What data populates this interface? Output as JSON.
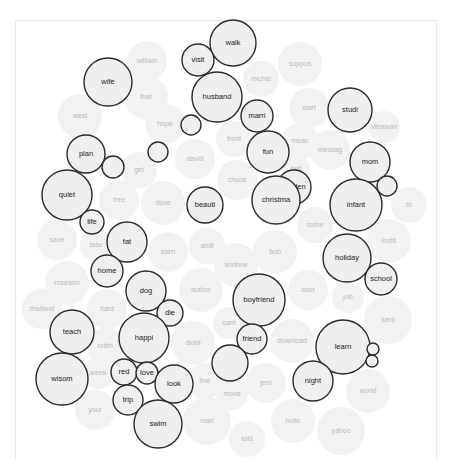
{
  "chart_data": {
    "type": "bubble-cloud",
    "title": "",
    "colors": {
      "highlight_stroke": "#2b2b2b",
      "highlight_fill": "#efefef",
      "background_fill": "#f2f2f2",
      "background_text": "#b8b8b8",
      "highlight_text": "#222222"
    },
    "background_words": [
      {
        "label": "william",
        "x": 147,
        "y": 61,
        "r": 20
      },
      {
        "label": "that",
        "x": 146,
        "y": 97,
        "r": 22
      },
      {
        "label": "west",
        "x": 80,
        "y": 116,
        "r": 22
      },
      {
        "label": "hope",
        "x": 165,
        "y": 124,
        "r": 20
      },
      {
        "label": "michel",
        "x": 261,
        "y": 79,
        "r": 18
      },
      {
        "label": "suppos",
        "x": 300,
        "y": 64,
        "r": 22
      },
      {
        "label": "start",
        "x": 309,
        "y": 108,
        "r": 20
      },
      {
        "label": "vitrawan",
        "x": 384,
        "y": 127,
        "r": 16
      },
      {
        "label": "front",
        "x": 234,
        "y": 139,
        "r": 18
      },
      {
        "label": "mean",
        "x": 300,
        "y": 141,
        "r": 18
      },
      {
        "label": "messag",
        "x": 330,
        "y": 150,
        "r": 20
      },
      {
        "label": "david",
        "x": 195,
        "y": 159,
        "r": 20
      },
      {
        "label": "get",
        "x": 139,
        "y": 170,
        "r": 18
      },
      {
        "label": "choos",
        "x": 237,
        "y": 180,
        "r": 20
      },
      {
        "label": "twit",
        "x": 296,
        "y": 169,
        "r": 14
      },
      {
        "label": "free",
        "x": 119,
        "y": 200,
        "r": 20
      },
      {
        "label": "dove",
        "x": 163,
        "y": 203,
        "r": 22
      },
      {
        "label": "tri",
        "x": 409,
        "y": 205,
        "r": 18
      },
      {
        "label": "come",
        "x": 315,
        "y": 225,
        "r": 18
      },
      {
        "label": "save",
        "x": 57,
        "y": 240,
        "r": 20
      },
      {
        "label": "leav",
        "x": 96,
        "y": 245,
        "r": 16
      },
      {
        "label": "instit",
        "x": 389,
        "y": 241,
        "r": 22
      },
      {
        "label": "barri",
        "x": 168,
        "y": 252,
        "r": 20
      },
      {
        "label": "andi",
        "x": 207,
        "y": 246,
        "r": 18
      },
      {
        "label": "bob",
        "x": 275,
        "y": 252,
        "r": 22
      },
      {
        "label": "andrew",
        "x": 236,
        "y": 265,
        "r": 22
      },
      {
        "label": "roseann",
        "x": 67,
        "y": 283,
        "r": 22
      },
      {
        "label": "author",
        "x": 201,
        "y": 290,
        "r": 22
      },
      {
        "label": "door",
        "x": 308,
        "y": 290,
        "r": 20
      },
      {
        "label": "job",
        "x": 348,
        "y": 297,
        "r": 16
      },
      {
        "label": "thailand",
        "x": 42,
        "y": 309,
        "r": 20
      },
      {
        "label": "hard",
        "x": 107,
        "y": 309,
        "r": 20
      },
      {
        "label": "sent",
        "x": 388,
        "y": 320,
        "r": 24
      },
      {
        "label": "cant",
        "x": 229,
        "y": 323,
        "r": 16
      },
      {
        "label": "robin",
        "x": 105,
        "y": 346,
        "r": 18
      },
      {
        "label": "didnt",
        "x": 193,
        "y": 343,
        "r": 22
      },
      {
        "label": "download",
        "x": 292,
        "y": 341,
        "r": 22
      },
      {
        "label": "week",
        "x": 98,
        "y": 373,
        "r": 16
      },
      {
        "label": "line",
        "x": 205,
        "y": 381,
        "r": 18
      },
      {
        "label": "jerri",
        "x": 266,
        "y": 383,
        "r": 20
      },
      {
        "label": "world",
        "x": 368,
        "y": 391,
        "r": 22
      },
      {
        "label": "move",
        "x": 232,
        "y": 394,
        "r": 16
      },
      {
        "label": "your",
        "x": 95,
        "y": 410,
        "r": 20
      },
      {
        "label": "marl",
        "x": 207,
        "y": 421,
        "r": 24
      },
      {
        "label": "notic",
        "x": 293,
        "y": 421,
        "r": 22
      },
      {
        "label": "yahoo",
        "x": 341,
        "y": 431,
        "r": 24
      },
      {
        "label": "told",
        "x": 247,
        "y": 439,
        "r": 18
      }
    ],
    "highlighted_words": [
      {
        "label": "walk",
        "x": 233,
        "y": 43,
        "r": 23
      },
      {
        "label": "visit",
        "x": 198,
        "y": 60,
        "r": 16
      },
      {
        "label": "wife",
        "x": 108,
        "y": 82,
        "r": 24
      },
      {
        "label": "husband",
        "x": 217,
        "y": 97,
        "r": 25
      },
      {
        "label": "",
        "x": 191,
        "y": 125,
        "r": 10
      },
      {
        "label": "marri",
        "x": 257,
        "y": 116,
        "r": 16
      },
      {
        "label": "studi",
        "x": 350,
        "y": 110,
        "r": 22
      },
      {
        "label": "plan",
        "x": 86,
        "y": 154,
        "r": 19
      },
      {
        "label": "",
        "x": 113,
        "y": 167,
        "r": 11
      },
      {
        "label": "",
        "x": 158,
        "y": 152,
        "r": 10
      },
      {
        "label": "fun",
        "x": 268,
        "y": 152,
        "r": 21
      },
      {
        "label": "mom",
        "x": 370,
        "y": 162,
        "r": 20
      },
      {
        "label": "",
        "x": 387,
        "y": 186,
        "r": 10
      },
      {
        "label": "quiet",
        "x": 67,
        "y": 195,
        "r": 25
      },
      {
        "label": "garden",
        "x": 294,
        "y": 187,
        "r": 17
      },
      {
        "label": "infant",
        "x": 356,
        "y": 205,
        "r": 26
      },
      {
        "label": "christma",
        "x": 276,
        "y": 200,
        "r": 24
      },
      {
        "label": "beauti",
        "x": 205,
        "y": 205,
        "r": 18
      },
      {
        "label": "life",
        "x": 92,
        "y": 222,
        "r": 12
      },
      {
        "label": "fat",
        "x": 127,
        "y": 242,
        "r": 20
      },
      {
        "label": "holiday",
        "x": 347,
        "y": 258,
        "r": 24
      },
      {
        "label": "home",
        "x": 107,
        "y": 271,
        "r": 16
      },
      {
        "label": "school",
        "x": 381,
        "y": 279,
        "r": 16
      },
      {
        "label": "dog",
        "x": 146,
        "y": 291,
        "r": 20
      },
      {
        "label": "die",
        "x": 170,
        "y": 313,
        "r": 13
      },
      {
        "label": "boyfriend",
        "x": 259,
        "y": 300,
        "r": 26
      },
      {
        "label": "teach",
        "x": 72,
        "y": 332,
        "r": 22
      },
      {
        "label": "happi",
        "x": 144,
        "y": 338,
        "r": 25
      },
      {
        "label": "learn",
        "x": 343,
        "y": 347,
        "r": 27
      },
      {
        "label": "friend",
        "x": 252,
        "y": 339,
        "r": 15
      },
      {
        "label": "",
        "x": 373,
        "y": 349,
        "r": 6
      },
      {
        "label": "",
        "x": 372,
        "y": 361,
        "r": 6
      },
      {
        "label": "",
        "x": 230,
        "y": 363,
        "r": 18
      },
      {
        "label": "wisom",
        "x": 62,
        "y": 379,
        "r": 26
      },
      {
        "label": "red",
        "x": 124,
        "y": 372,
        "r": 13
      },
      {
        "label": "love",
        "x": 147,
        "y": 373,
        "r": 11
      },
      {
        "label": "look",
        "x": 174,
        "y": 384,
        "r": 19
      },
      {
        "label": "night",
        "x": 313,
        "y": 381,
        "r": 20
      },
      {
        "label": "trip",
        "x": 128,
        "y": 400,
        "r": 15
      },
      {
        "label": "swim",
        "x": 158,
        "y": 424,
        "r": 24
      }
    ]
  }
}
